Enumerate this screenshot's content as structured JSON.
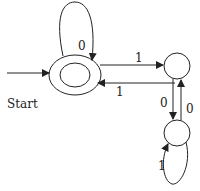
{
  "diagram": {
    "type": "finite state automaton",
    "start_label": "Start",
    "states": [
      {
        "id": "q0",
        "accepting": true,
        "start": true
      },
      {
        "id": "q1",
        "accepting": false
      },
      {
        "id": "q2",
        "accepting": false
      }
    ],
    "transitions": [
      {
        "from": "q0",
        "to": "q0",
        "label": "0"
      },
      {
        "from": "q0",
        "to": "q1",
        "label": "1"
      },
      {
        "from": "q1",
        "to": "q0",
        "label": "1"
      },
      {
        "from": "q1",
        "to": "q2",
        "label": "0"
      },
      {
        "from": "q2",
        "to": "q1",
        "label": "0"
      },
      {
        "from": "q2",
        "to": "q2",
        "label": "1"
      }
    ]
  }
}
